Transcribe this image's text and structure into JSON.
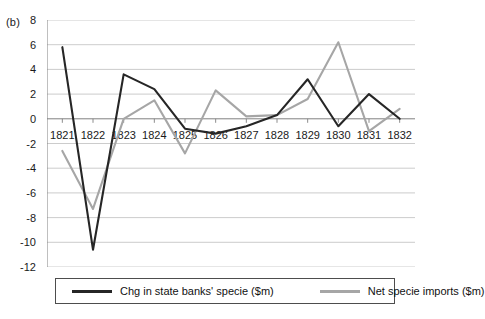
{
  "panel": {
    "label": "(b)"
  },
  "colors": {
    "series_black": "#262626",
    "series_gray": "#a6a6a6",
    "gridline": "#bfbfbf",
    "axis": "#808080",
    "text": "#1a1a1a"
  },
  "legend": {
    "items": [
      {
        "label": "Chg in state banks' specie ($m)",
        "color": "#262626"
      },
      {
        "label": "Net specie imports ($m)",
        "color": "#a6a6a6"
      }
    ]
  },
  "chart_data": {
    "type": "line",
    "title": "",
    "xlabel": "",
    "ylabel": "",
    "ylim": [
      -12,
      8
    ],
    "yticks": [
      8,
      6,
      4,
      2,
      0,
      -2,
      -4,
      -6,
      -8,
      -10,
      -12
    ],
    "ytick_labels": [
      "8",
      "6",
      "4",
      "2",
      "0",
      "-2",
      "-4",
      "-6",
      "-8",
      "-10",
      "-12"
    ],
    "grid": true,
    "legend_position": "bottom",
    "categories": [
      "1821",
      "1822",
      "1823",
      "1824",
      "1825",
      "1826",
      "1827",
      "1828",
      "1829",
      "1830",
      "1831",
      "1832"
    ],
    "series": [
      {
        "name": "Chg in state banks' specie ($m)",
        "color": "#262626",
        "values": [
          5.8,
          -10.6,
          3.6,
          2.4,
          -0.8,
          -1.2,
          -0.6,
          0.3,
          3.2,
          -0.6,
          2.0,
          0.0
        ]
      },
      {
        "name": "Net specie imports ($m)",
        "color": "#a6a6a6",
        "values": [
          -2.6,
          -7.3,
          0.0,
          1.5,
          -2.8,
          2.3,
          0.2,
          0.3,
          1.6,
          6.2,
          -1.0,
          0.8
        ]
      }
    ]
  }
}
